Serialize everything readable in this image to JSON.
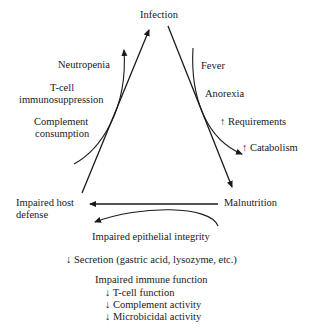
{
  "nodes": {
    "infection": "Infection",
    "malnutrition": "Malnutrition",
    "impaired_host_defense_line1": "Impaired host",
    "impaired_host_defense_line2": "defense"
  },
  "left_side_effects": {
    "neutropenia": "Neutropenia",
    "tcell_line1": "T-cell",
    "tcell_line2": "immunosuppression",
    "complement_line1": "Complement",
    "complement_line2": "consumption"
  },
  "right_side_effects": {
    "fever": "Fever",
    "anorexia": "Anorexia",
    "requirements": "↑ Requirements",
    "catabolism": "↑ Catabolism"
  },
  "bottom_effects": {
    "epithelial": "Impaired epithelial integrity",
    "secretion": "↓ Secretion (gastric acid, lysozyme, etc.)",
    "immune_title": "Impaired immune function",
    "immune_items": [
      "↓ T-cell function",
      "↓ Complement activity",
      "↓ Microbicidal activity"
    ]
  }
}
